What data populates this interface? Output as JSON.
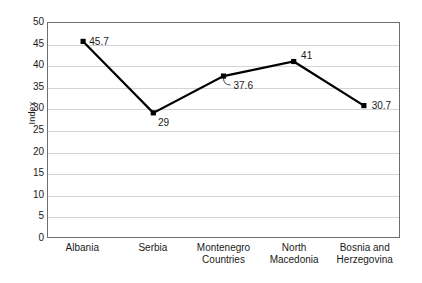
{
  "chart_data": {
    "type": "line",
    "title": "",
    "subtitle": "",
    "xlabel": "Countries",
    "ylabel": "Index",
    "categories": [
      "Albania",
      "Serbia",
      "Montenegro",
      "North Macedonia",
      "Bosnia and Herzegovina"
    ],
    "category_lines": [
      [
        "Albania",
        ""
      ],
      [
        "Serbia",
        ""
      ],
      [
        "Montenegro",
        ""
      ],
      [
        "North",
        "Macedonia"
      ],
      [
        "Bosnia and",
        "Herzegovina"
      ]
    ],
    "values": [
      45.7,
      29,
      37.6,
      41,
      30.7
    ],
    "point_labels": [
      "45.7",
      "29",
      "37.6",
      "41",
      "30.7"
    ],
    "ylim": [
      0,
      50
    ],
    "ytick_step": 5,
    "yticks": [
      "50",
      "45",
      "40",
      "35",
      "30",
      "25",
      "20",
      "15",
      "10",
      "5",
      "0"
    ],
    "grid": true,
    "grid_axis": "y",
    "legend": "none",
    "series": [
      {
        "name": "Index",
        "values": [
          45.7,
          29,
          37.6,
          41,
          30.7
        ],
        "marker": "square",
        "line_color": "#000000",
        "marker_color": "#000000"
      }
    ]
  },
  "style": {
    "background": "#ffffff",
    "grid_color": "#d4d4d4",
    "frame_color": "#6e6e6e",
    "text_color": "#1a1a1a",
    "line_color": "#000000"
  }
}
